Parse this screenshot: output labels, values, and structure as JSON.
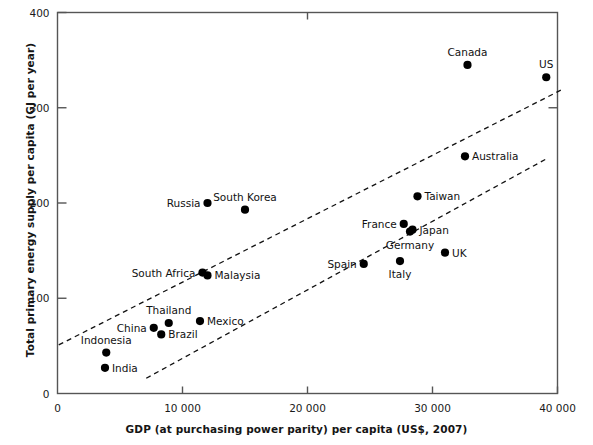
{
  "chart_data": {
    "type": "scatter",
    "title": "",
    "xlabel": "GDP (at purchasing power parity) per capita (US$, 2007)",
    "ylabel": "Total primary energy supply per capita (GJ per year)",
    "xlim": [
      0,
      40000
    ],
    "ylim": [
      0,
      400
    ],
    "xticks": [
      0,
      10000,
      20000,
      30000,
      40000
    ],
    "xticklabels": [
      "0",
      "10 000",
      "20 000",
      "30 000",
      "40 000"
    ],
    "yticks": [
      0,
      100,
      200,
      300,
      400
    ],
    "yticklabels": [
      "0",
      "100",
      "200",
      "300",
      "400"
    ],
    "grid": false,
    "legend": "none",
    "marker_color": "#000000",
    "axis_color": "#555555",
    "points": [
      {
        "label": "Canada",
        "x": 32800,
        "y": 345,
        "label_pos": "above"
      },
      {
        "label": "US",
        "x": 39100,
        "y": 332,
        "label_pos": "above"
      },
      {
        "label": "Australia",
        "x": 32600,
        "y": 249,
        "label_pos": "right"
      },
      {
        "label": "Taiwan",
        "x": 28800,
        "y": 207,
        "label_pos": "right"
      },
      {
        "label": "Russia",
        "x": 12000,
        "y": 200,
        "label_pos": "left"
      },
      {
        "label": "South Korea",
        "x": 15000,
        "y": 193,
        "label_pos": "above"
      },
      {
        "label": "France",
        "x": 27700,
        "y": 178,
        "label_pos": "left"
      },
      {
        "label": "Japan",
        "x": 28400,
        "y": 172,
        "label_pos": "right"
      },
      {
        "label": "Germany",
        "x": 28200,
        "y": 170,
        "label_pos": "below"
      },
      {
        "label": "UK",
        "x": 31000,
        "y": 148,
        "label_pos": "right"
      },
      {
        "label": "Italy",
        "x": 27400,
        "y": 139,
        "label_pos": "below"
      },
      {
        "label": "Spain",
        "x": 24500,
        "y": 136,
        "label_pos": "left"
      },
      {
        "label": "South Africa",
        "x": 11600,
        "y": 127,
        "label_pos": "left"
      },
      {
        "label": "Malaysia",
        "x": 12000,
        "y": 124,
        "label_pos": "right"
      },
      {
        "label": "Mexico",
        "x": 11400,
        "y": 76,
        "label_pos": "right"
      },
      {
        "label": "Thailand",
        "x": 8900,
        "y": 74,
        "label_pos": "above"
      },
      {
        "label": "China",
        "x": 7700,
        "y": 69,
        "label_pos": "left"
      },
      {
        "label": "Brazil",
        "x": 8300,
        "y": 62,
        "label_pos": "right"
      },
      {
        "label": "Indonesia",
        "x": 3900,
        "y": 43,
        "label_pos": "above"
      },
      {
        "label": "India",
        "x": 3800,
        "y": 27,
        "label_pos": "right"
      }
    ],
    "trend_lines": [
      {
        "name": "upper-dashed-trend",
        "x0": 100,
        "y0": 51,
        "x1": 40500,
        "y1": 320,
        "style": "dashed"
      },
      {
        "name": "lower-dashed-trend",
        "x0": 7100,
        "y0": 16,
        "x1": 39200,
        "y1": 247,
        "style": "dashed"
      }
    ]
  }
}
